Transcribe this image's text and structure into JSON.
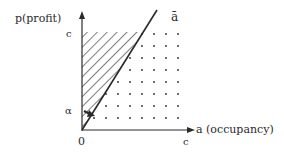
{
  "diagram": {
    "y_axis_label": "p(profit)",
    "x_axis_label": "a (occupancy)",
    "y_tick_label": "c",
    "x_tick_label": "c",
    "origin_label": "0",
    "alpha_label": "α",
    "line_label": "ā",
    "colors": {
      "ink": "#2a2a2a",
      "background": "#ffffff"
    },
    "regions": [
      {
        "name": "hatched-region",
        "description": "area above line ā, left of it (diagonal hatching)"
      },
      {
        "name": "dotted-region",
        "description": "area below line ā (dot grid)"
      }
    ]
  }
}
